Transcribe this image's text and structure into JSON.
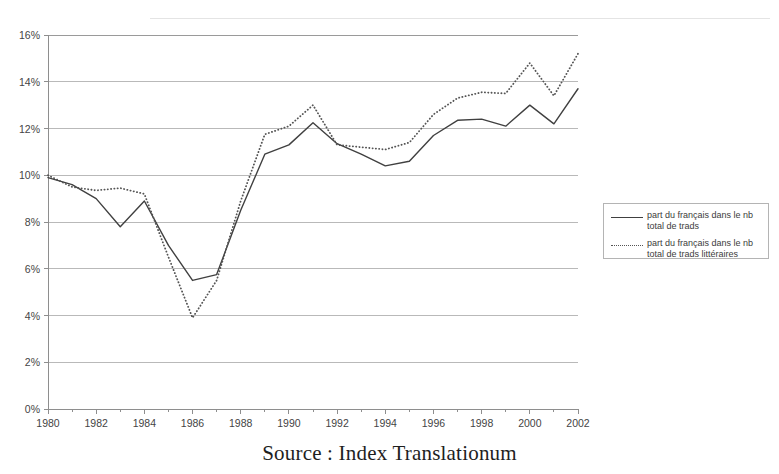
{
  "caption": "Source : Index Translationum",
  "legend": {
    "items": [
      {
        "style": "solid",
        "label": "part du français dans le nb total de trads"
      },
      {
        "style": "dotted",
        "label": "part du français dans le nb total de trads littéraires"
      }
    ]
  },
  "chart_data": {
    "type": "line",
    "title": "",
    "xlabel": "",
    "ylabel": "",
    "x": [
      1980,
      1981,
      1982,
      1983,
      1984,
      1985,
      1986,
      1987,
      1988,
      1989,
      1990,
      1991,
      1992,
      1993,
      1994,
      1995,
      1996,
      1997,
      1998,
      1999,
      2000,
      2001,
      2002
    ],
    "xtick_labels": [
      "1980",
      "1982",
      "1984",
      "1986",
      "1988",
      "1990",
      "1992",
      "1994",
      "1996",
      "1998",
      "2000",
      "2002"
    ],
    "xtick_values": [
      1980,
      1982,
      1984,
      1986,
      1988,
      1990,
      1992,
      1994,
      1996,
      1998,
      2000,
      2002
    ],
    "xlim": [
      1980,
      2002
    ],
    "ytick_labels": [
      "0%",
      "2%",
      "4%",
      "6%",
      "8%",
      "10%",
      "12%",
      "14%",
      "16%"
    ],
    "ytick_values": [
      0,
      2,
      4,
      6,
      8,
      10,
      12,
      14,
      16
    ],
    "ylim": [
      0,
      16
    ],
    "grid": "horizontal",
    "legend_position": "right-outside",
    "series": [
      {
        "name": "part du français dans le nb total de trads",
        "style": "solid",
        "color": "#404040",
        "values": [
          9.9,
          9.6,
          9.0,
          7.8,
          8.9,
          7.0,
          5.5,
          5.75,
          8.5,
          10.9,
          11.3,
          12.25,
          11.35,
          10.9,
          10.4,
          10.6,
          11.7,
          12.35,
          12.4,
          12.1,
          13.0,
          12.2,
          13.7
        ]
      },
      {
        "name": "part du français dans le nb total de trads littéraires",
        "style": "dotted",
        "color": "#555555",
        "values": [
          10.0,
          9.5,
          9.35,
          9.45,
          9.2,
          6.5,
          3.9,
          5.5,
          8.9,
          11.75,
          12.1,
          13.0,
          11.3,
          11.2,
          11.1,
          11.4,
          12.6,
          13.3,
          13.55,
          13.5,
          14.8,
          13.4,
          15.2
        ]
      }
    ]
  }
}
